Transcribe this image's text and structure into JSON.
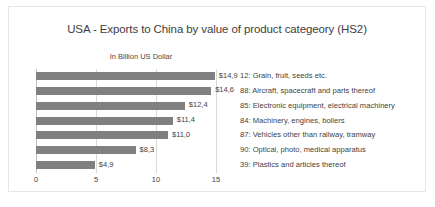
{
  "chart_data": {
    "type": "bar",
    "orientation": "horizontal",
    "title": "USA - Exports to China by value of product categeory (HS2)",
    "subtitle": "In Billion US Dollar",
    "xlabel": "",
    "ylabel": "",
    "xlim": [
      0,
      15
    ],
    "grid": true,
    "legend_position": "right",
    "tick_labels": [
      "0",
      "5",
      "10",
      "15"
    ],
    "tick_values": [
      0,
      5,
      10,
      15
    ],
    "bar_color": "#808080",
    "categories": [
      "12: Grain, fruit, seeds etc.",
      "88: Aircraft, spacecraft and parts thereof",
      "85: Electronic equipment, electrical machinery",
      "84: Machinery, engines, boilers",
      "87: Vehicles other than railway, tramway",
      "90: Optical, photo, medical apparatus",
      "39: Plastics and articles thereof"
    ],
    "values": [
      14.9,
      14.6,
      12.4,
      11.4,
      11.0,
      8.3,
      4.9
    ],
    "data_labels": [
      "$14,9",
      "$14,6",
      "$12,4",
      "$11,4",
      "$11,0",
      "$8,3",
      "$4,9"
    ]
  },
  "footer": {
    "caption": ""
  }
}
